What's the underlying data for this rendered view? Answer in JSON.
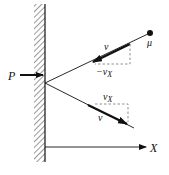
{
  "diagram": {
    "type": "physics-reflection",
    "labels": {
      "particle": "μ",
      "incident_velocity": "v",
      "incident_x_component": "−v",
      "incident_x_subscript": "X",
      "reflected_x_component": "v",
      "reflected_x_subscript": "X",
      "reflected_velocity": "v",
      "force": "P",
      "axis": "X"
    },
    "colors": {
      "ink": "#111111",
      "dashed": "#777777",
      "hatch": "#444444",
      "background": "#ffffff"
    }
  }
}
